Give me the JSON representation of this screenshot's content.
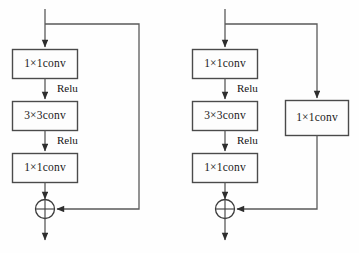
{
  "figure": {
    "background_color": "#fefefe",
    "line_color": "#5a5a5a",
    "box_stroke_color": "#4a4a4a",
    "box_fill_color": "#fdfdfd",
    "text_color": "#1a1a1a"
  },
  "blocks": [
    {
      "id": "identity-residual-block",
      "name": "identity-shortcut-block",
      "main_path": [
        {
          "label": "1×1conv"
        },
        {
          "label": "3×3conv"
        },
        {
          "label": "1×1conv"
        }
      ],
      "edge_labels": [
        {
          "label": "Relu"
        },
        {
          "label": "Relu"
        }
      ],
      "shortcut": {
        "type": "identity",
        "label": ""
      },
      "merge": {
        "operator": "⊕",
        "name": "element-wise-addition"
      }
    },
    {
      "id": "projection-residual-block",
      "name": "projection-shortcut-block",
      "main_path": [
        {
          "label": "1×1conv"
        },
        {
          "label": "3×3conv"
        },
        {
          "label": "1×1conv"
        }
      ],
      "edge_labels": [
        {
          "label": "Relu"
        },
        {
          "label": "Relu"
        }
      ],
      "shortcut": {
        "type": "projection",
        "label": "1×1conv"
      },
      "merge": {
        "operator": "⊕",
        "name": "element-wise-addition"
      }
    }
  ]
}
